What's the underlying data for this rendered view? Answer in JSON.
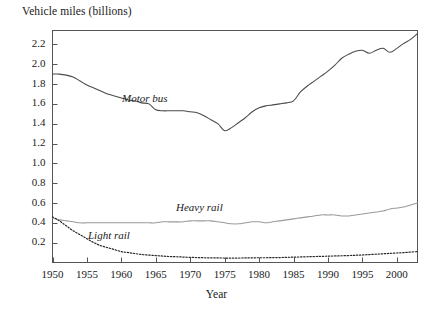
{
  "chart_data": {
    "type": "line",
    "title": "",
    "ylabel": "Vehicle miles (billions)",
    "xlabel": "Year",
    "grid": false,
    "legend_position": "inline-annotations",
    "xlim": [
      1950,
      2003
    ],
    "ylim": [
      0.0,
      2.34
    ],
    "xticks": [
      1950,
      1955,
      1960,
      1965,
      1970,
      1975,
      1980,
      1985,
      1990,
      1995,
      2000
    ],
    "xtick_labels": [
      "1950",
      "1955",
      "1960",
      "1965",
      "1970",
      "1975",
      "1980",
      "1985",
      "1990",
      "1995",
      "2000"
    ],
    "yticks": [
      0.2,
      0.4,
      0.6,
      0.8,
      1.0,
      1.2,
      1.4,
      1.6,
      1.8,
      2.0,
      2.2
    ],
    "ytick_labels": [
      "0.2",
      "0.4",
      "0.6",
      "0.8",
      "1.0",
      "1.2",
      "1.4",
      "1.6",
      "1.8",
      "2.0",
      "2.2"
    ],
    "x": [
      1950,
      1951,
      1952,
      1953,
      1954,
      1955,
      1956,
      1957,
      1958,
      1959,
      1960,
      1961,
      1962,
      1963,
      1964,
      1965,
      1966,
      1967,
      1968,
      1969,
      1970,
      1971,
      1972,
      1973,
      1974,
      1975,
      1976,
      1977,
      1978,
      1979,
      1980,
      1981,
      1982,
      1983,
      1984,
      1985,
      1986,
      1987,
      1988,
      1989,
      1990,
      1991,
      1992,
      1993,
      1994,
      1995,
      1996,
      1997,
      1998,
      1999,
      2000,
      2001,
      2002,
      2003
    ],
    "series": [
      {
        "name": "Motor bus",
        "color": "#4a4a4a",
        "style": "solid",
        "label_x": 1964,
        "label_y": 1.66,
        "values": [
          1.9,
          1.9,
          1.89,
          1.87,
          1.83,
          1.79,
          1.76,
          1.73,
          1.7,
          1.68,
          1.66,
          1.64,
          1.63,
          1.61,
          1.6,
          1.54,
          1.53,
          1.53,
          1.53,
          1.53,
          1.52,
          1.51,
          1.48,
          1.44,
          1.4,
          1.33,
          1.36,
          1.41,
          1.46,
          1.52,
          1.56,
          1.58,
          1.59,
          1.6,
          1.61,
          1.63,
          1.72,
          1.78,
          1.83,
          1.88,
          1.93,
          1.99,
          2.06,
          2.1,
          2.13,
          2.14,
          2.11,
          2.14,
          2.16,
          2.12,
          2.16,
          2.21,
          2.25,
          2.31
        ]
      },
      {
        "name": "Heavy rail",
        "color": "#9a9a9a",
        "style": "solid",
        "label_x": 1972,
        "label_y": 0.56,
        "values": [
          0.45,
          0.43,
          0.42,
          0.41,
          0.4,
          0.4,
          0.4,
          0.4,
          0.4,
          0.4,
          0.4,
          0.4,
          0.4,
          0.4,
          0.4,
          0.4,
          0.41,
          0.41,
          0.41,
          0.41,
          0.42,
          0.42,
          0.42,
          0.42,
          0.41,
          0.4,
          0.39,
          0.39,
          0.4,
          0.41,
          0.41,
          0.4,
          0.41,
          0.42,
          0.43,
          0.44,
          0.45,
          0.46,
          0.47,
          0.48,
          0.48,
          0.48,
          0.47,
          0.47,
          0.48,
          0.49,
          0.5,
          0.51,
          0.52,
          0.54,
          0.55,
          0.56,
          0.58,
          0.6
        ]
      },
      {
        "name": "Light rail",
        "color": "#2a2a2a",
        "style": "dotted",
        "label_x": 1957,
        "label_y": 0.26,
        "values": [
          0.46,
          0.42,
          0.37,
          0.32,
          0.28,
          0.24,
          0.2,
          0.17,
          0.15,
          0.13,
          0.11,
          0.1,
          0.09,
          0.08,
          0.075,
          0.07,
          0.065,
          0.06,
          0.058,
          0.055,
          0.052,
          0.05,
          0.048,
          0.047,
          0.046,
          0.045,
          0.045,
          0.045,
          0.046,
          0.047,
          0.048,
          0.048,
          0.049,
          0.05,
          0.052,
          0.054,
          0.056,
          0.058,
          0.06,
          0.062,
          0.064,
          0.066,
          0.068,
          0.07,
          0.073,
          0.076,
          0.08,
          0.084,
          0.088,
          0.092,
          0.096,
          0.1,
          0.105,
          0.11
        ]
      }
    ],
    "axis_frame_color": "#555555"
  }
}
